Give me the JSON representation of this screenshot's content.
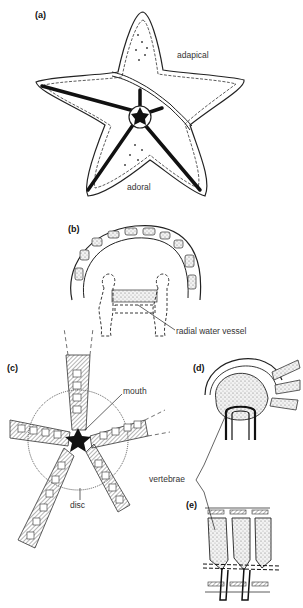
{
  "figure": {
    "panels": [
      {
        "id": "a",
        "label": "(a)",
        "annotations": [
          "adapical",
          "adoral"
        ]
      },
      {
        "id": "b",
        "label": "(b)",
        "annotations": [
          "radial water vessel"
        ]
      },
      {
        "id": "c",
        "label": "(c)",
        "annotations": [
          "mouth",
          "disc"
        ]
      },
      {
        "id": "d",
        "label": "(d)",
        "annotations": [
          "vertebrae"
        ]
      },
      {
        "id": "e",
        "label": "(e)",
        "annotations": []
      }
    ],
    "colors": {
      "line": "#1a1a1a",
      "stipple": "#cfcfcf",
      "background": "#ffffff"
    }
  }
}
